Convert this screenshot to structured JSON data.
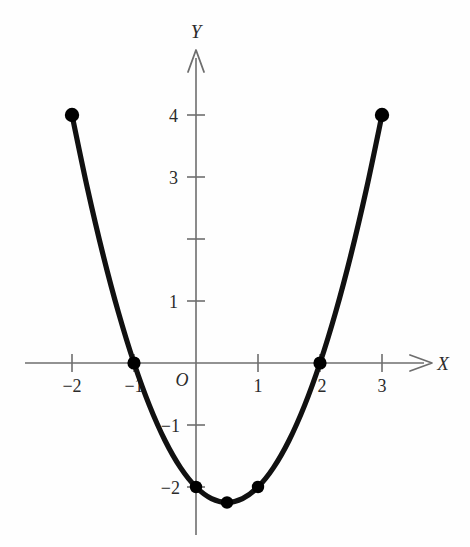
{
  "figure": {
    "background_color": "#fefefe",
    "axis_color": "#6e6e6e",
    "curve_color": "#111111",
    "point_color": "#000000",
    "text_color": "#2b2b2b"
  },
  "labels": {
    "x_axis": "X",
    "y_axis": "Y",
    "origin": "O"
  },
  "chart_data": {
    "type": "line",
    "title": "",
    "xlabel": "X",
    "ylabel": "Y",
    "equation": "y = x^2 - x - 2",
    "xlim": [
      -2.75,
      4.4
    ],
    "ylim": [
      -3.05,
      5.05
    ],
    "grid": false,
    "legend": false,
    "x_ticks": [
      -2,
      -1,
      1,
      2,
      3
    ],
    "x_tick_labels": [
      "−2",
      "−1",
      "1",
      "2",
      "3"
    ],
    "y_ticks": [
      4,
      3,
      2,
      1,
      -1,
      -2
    ],
    "y_tick_labels": [
      "4",
      "3",
      "",
      "1",
      "−1",
      "−2"
    ],
    "marked_points": [
      {
        "x": -2,
        "y": 4,
        "label": "(-2, 4)"
      },
      {
        "x": -1,
        "y": 0,
        "label": "(-1, 0)"
      },
      {
        "x": 0,
        "y": -2,
        "label": "(0, -2)"
      },
      {
        "x": 0.5,
        "y": -2.25,
        "label": "(0.5, -2.25)"
      },
      {
        "x": 1,
        "y": -2,
        "label": "(1, -2)"
      },
      {
        "x": 2,
        "y": 0,
        "label": "(2, 0)"
      },
      {
        "x": 3,
        "y": 4,
        "label": "(3, 4)"
      }
    ],
    "x": [
      -2,
      -1.75,
      -1.5,
      -1.25,
      -1,
      -0.75,
      -0.5,
      -0.25,
      0,
      0.25,
      0.5,
      0.75,
      1,
      1.25,
      1.5,
      1.75,
      2,
      2.25,
      2.5,
      2.75,
      3
    ],
    "values": [
      4,
      2.8125,
      1.75,
      0.8125,
      0,
      -0.6875,
      -1.25,
      -1.6875,
      -2,
      -2.1875,
      -2.25,
      -2.1875,
      -2,
      -1.6875,
      -1.25,
      -0.6875,
      0,
      0.8125,
      1.75,
      2.8125,
      4
    ]
  },
  "geometry": {
    "origin_px": {
      "x": 196,
      "y": 363
    },
    "unit_px": 62
  }
}
